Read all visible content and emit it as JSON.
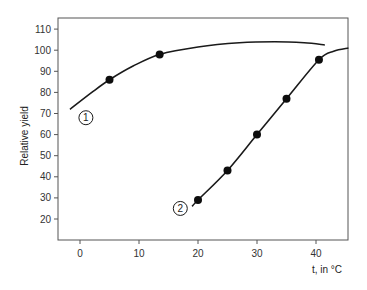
{
  "chart_data": {
    "type": "line",
    "title": "",
    "xlabel": "t, in °C",
    "ylabel": "Relative yield",
    "xlim": [
      -3,
      46
    ],
    "ylim": [
      10,
      114
    ],
    "x_ticks": [
      0,
      10,
      20,
      30,
      40
    ],
    "y_ticks": [
      20,
      30,
      40,
      50,
      60,
      70,
      80,
      90,
      100,
      110
    ],
    "grid": false,
    "legend": "none (curves labeled with circled numbers 1 and 2)",
    "series": [
      {
        "name": "1",
        "markers": [
          {
            "x": 5,
            "y": 86
          },
          {
            "x": 13.5,
            "y": 98
          }
        ],
        "curve": [
          {
            "x": -1.7,
            "y": 72
          },
          {
            "x": 2,
            "y": 80
          },
          {
            "x": 5,
            "y": 86
          },
          {
            "x": 9,
            "y": 92.5
          },
          {
            "x": 13.5,
            "y": 98
          },
          {
            "x": 20,
            "y": 101.5
          },
          {
            "x": 27,
            "y": 103.5
          },
          {
            "x": 33,
            "y": 104
          },
          {
            "x": 38,
            "y": 103.5
          },
          {
            "x": 41.5,
            "y": 102.5
          }
        ]
      },
      {
        "name": "2",
        "markers": [
          {
            "x": 20,
            "y": 29
          },
          {
            "x": 25,
            "y": 43
          },
          {
            "x": 30,
            "y": 60
          },
          {
            "x": 35,
            "y": 77
          },
          {
            "x": 40.5,
            "y": 95.5
          }
        ],
        "curve": [
          {
            "x": 19,
            "y": 26
          },
          {
            "x": 20,
            "y": 29
          },
          {
            "x": 25,
            "y": 43
          },
          {
            "x": 30,
            "y": 60
          },
          {
            "x": 35,
            "y": 77
          },
          {
            "x": 40.5,
            "y": 95.5
          },
          {
            "x": 43,
            "y": 99.5
          },
          {
            "x": 45.5,
            "y": 101
          }
        ]
      }
    ],
    "annotations": [
      {
        "text": "1",
        "x": 1,
        "y": 68,
        "style": "circled"
      },
      {
        "text": "2",
        "x": 17,
        "y": 25,
        "style": "circled"
      }
    ]
  },
  "colors": {
    "line": "#1a1a1a",
    "marker": "#0d0d0d",
    "axis": "#555555"
  }
}
